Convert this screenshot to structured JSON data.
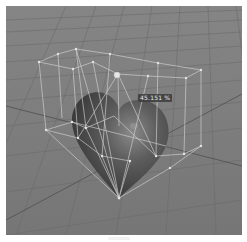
{
  "viewport": {
    "background_color": "#7b7b7b",
    "grid_color": "#6d6d6d",
    "object": "heart-mesh",
    "object_color": "#4a4a4a",
    "cage_color": "#d8d8d8",
    "handle_color": "#e0e0e0"
  },
  "overlay": {
    "percent_label": "45.151 %"
  }
}
